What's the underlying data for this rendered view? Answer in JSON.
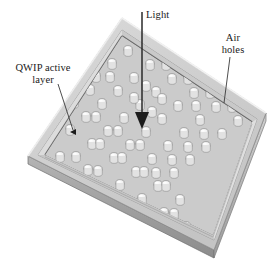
{
  "figure": {
    "width": 279,
    "height": 268,
    "background": "#ffffff"
  },
  "labels": {
    "light": "Light",
    "air_holes_line1": "Air",
    "air_holes_line2": "holes",
    "qwip_line1": "QWIP active",
    "qwip_line2": "layer"
  },
  "colors": {
    "ink": "#1a1a1a",
    "plate_top": "#d2d2d2",
    "plate_top_shade": "#c2c2c2",
    "rim_light": "#e4e4e4",
    "rim_mid": "#b9b9b9",
    "rim_dark": "#7d7d7d",
    "side_dark": "#9a9a9a",
    "side_darker": "#6e6e6e",
    "hole_fill": "#f2f2f2",
    "hole_edge": "#8a8a8a",
    "arrow": "#2a2a2a",
    "leader": "#4a4a4a"
  },
  "geometry": {
    "plate_corners": {
      "top": [
        122,
        18
      ],
      "right": [
        266,
        113
      ],
      "bottom": [
        214,
        250
      ],
      "left": [
        28,
        156
      ]
    },
    "light_arrow": {
      "x": 142,
      "y_start": 12,
      "y_end": 128,
      "head_width": 14,
      "head_height": 16
    },
    "qwip_leader": {
      "from": [
        58,
        84
      ],
      "to": [
        74,
        132
      ]
    },
    "air_holes_leader": {
      "from": [
        229,
        58
      ],
      "to": [
        224,
        104
      ]
    },
    "hole_grid": {
      "rows": 9,
      "cols": 9,
      "hole_radius_x": 4.2,
      "hole_radius_y": 3.4,
      "total_holes": 81
    }
  }
}
